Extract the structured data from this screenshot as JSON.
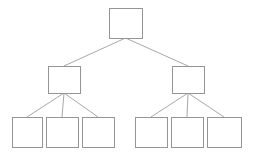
{
  "diagram": {
    "type": "tree-diagram",
    "title": "",
    "background_color": "#ffffff",
    "box_stroke_color": "#959595",
    "box_fill_color": "#ffffff",
    "connector_color": "#a8a8a8",
    "levels": 3,
    "total_nodes": 9,
    "nodes": [
      {
        "id": "root",
        "label": "",
        "level": 0,
        "x": 109,
        "y": 8,
        "width": 33,
        "height": 30,
        "children": [
          "mid-left",
          "mid-right"
        ]
      },
      {
        "id": "mid-left",
        "label": "",
        "level": 1,
        "x": 48,
        "y": 66,
        "width": 32,
        "height": 27,
        "children": [
          "leaf-1",
          "leaf-2",
          "leaf-3"
        ]
      },
      {
        "id": "mid-right",
        "label": "",
        "level": 1,
        "x": 172,
        "y": 66,
        "width": 32,
        "height": 27,
        "children": [
          "leaf-4",
          "leaf-5",
          "leaf-6"
        ]
      },
      {
        "id": "leaf-1",
        "label": "",
        "level": 2,
        "x": 12,
        "y": 117,
        "width": 30,
        "height": 30,
        "children": []
      },
      {
        "id": "leaf-2",
        "label": "",
        "level": 2,
        "x": 46,
        "y": 117,
        "width": 32,
        "height": 30,
        "children": []
      },
      {
        "id": "leaf-3",
        "label": "",
        "level": 2,
        "x": 82,
        "y": 117,
        "width": 32,
        "height": 30,
        "children": []
      },
      {
        "id": "leaf-4",
        "label": "",
        "level": 2,
        "x": 135,
        "y": 117,
        "width": 32,
        "height": 30,
        "children": []
      },
      {
        "id": "leaf-5",
        "label": "",
        "level": 2,
        "x": 171,
        "y": 117,
        "width": 32,
        "height": 30,
        "children": []
      },
      {
        "id": "leaf-6",
        "label": "",
        "level": 2,
        "x": 207,
        "y": 117,
        "width": 34,
        "height": 30,
        "children": []
      }
    ],
    "edges": [
      {
        "from": "root",
        "to": "mid-left"
      },
      {
        "from": "root",
        "to": "mid-right"
      },
      {
        "from": "mid-left",
        "to": "leaf-1"
      },
      {
        "from": "mid-left",
        "to": "leaf-2"
      },
      {
        "from": "mid-left",
        "to": "leaf-3"
      },
      {
        "from": "mid-right",
        "to": "leaf-4"
      },
      {
        "from": "mid-right",
        "to": "leaf-5"
      },
      {
        "from": "mid-right",
        "to": "leaf-6"
      }
    ]
  }
}
